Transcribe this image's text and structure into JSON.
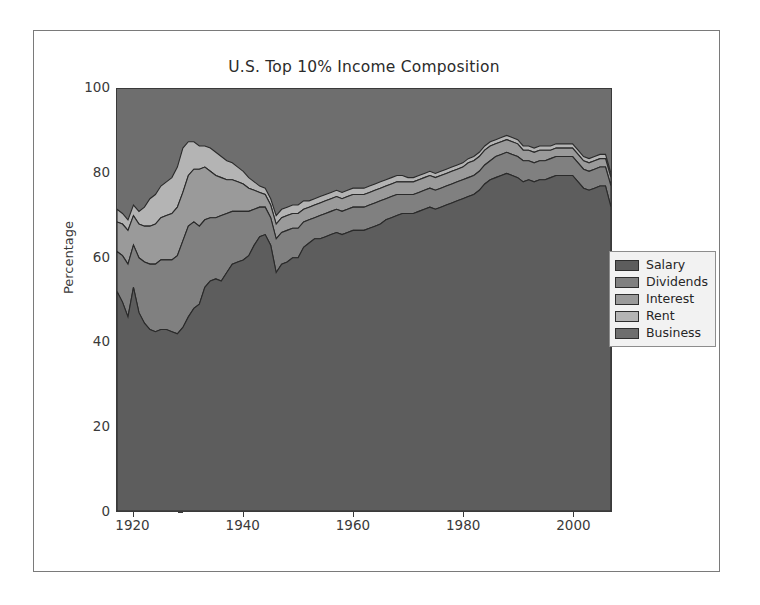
{
  "figure": {
    "title": "U.S. Top 10% Income Composition",
    "background": "#ffffff",
    "frame_color": "#7a7a7a"
  },
  "legend": {
    "position": "center-right-outside",
    "border_color": "#8d8d8d",
    "background": "#f2f2f2"
  },
  "chart_data": {
    "type": "area",
    "title": "U.S. Top 10% Income Composition",
    "xlabel": "",
    "ylabel": "Percentage",
    "xlim": [
      1917,
      2007
    ],
    "ylim": [
      0,
      100
    ],
    "xticks": [
      1920,
      1940,
      1960,
      1980,
      2000
    ],
    "yticks": [
      0,
      20,
      40,
      60,
      80,
      100
    ],
    "grid": false,
    "stacked": true,
    "legend_position": "center right",
    "x": [
      1917,
      1918,
      1919,
      1920,
      1921,
      1922,
      1923,
      1924,
      1925,
      1926,
      1927,
      1928,
      1929,
      1930,
      1931,
      1932,
      1933,
      1934,
      1935,
      1936,
      1937,
      1938,
      1939,
      1940,
      1941,
      1942,
      1943,
      1944,
      1945,
      1946,
      1947,
      1948,
      1949,
      1950,
      1951,
      1952,
      1953,
      1954,
      1955,
      1956,
      1957,
      1958,
      1959,
      1960,
      1961,
      1962,
      1963,
      1964,
      1965,
      1966,
      1967,
      1968,
      1969,
      1970,
      1971,
      1972,
      1973,
      1974,
      1975,
      1976,
      1977,
      1978,
      1979,
      1980,
      1981,
      1982,
      1983,
      1984,
      1985,
      1986,
      1987,
      1988,
      1989,
      1990,
      1991,
      1992,
      1993,
      1994,
      1995,
      1996,
      1997,
      1998,
      1999,
      2000,
      2001,
      2002,
      2003,
      2004,
      2005,
      2006,
      2007
    ],
    "series": [
      {
        "name": "Salary",
        "color": "#5d5d5d",
        "values": [
          52.0,
          49.5,
          46.0,
          53.0,
          47.0,
          44.5,
          43.0,
          42.5,
          43.0,
          43.0,
          42.5,
          42.0,
          43.5,
          46.0,
          48.0,
          49.0,
          53.0,
          54.5,
          55.0,
          54.5,
          56.5,
          58.5,
          59.0,
          59.5,
          60.5,
          63.0,
          65.0,
          65.5,
          63.0,
          56.5,
          58.5,
          59.0,
          60.0,
          60.0,
          62.5,
          63.5,
          64.5,
          64.5,
          65.0,
          65.5,
          66.0,
          65.5,
          66.0,
          66.5,
          66.5,
          66.5,
          67.0,
          67.5,
          68.0,
          69.0,
          69.5,
          70.0,
          70.5,
          70.5,
          70.5,
          71.0,
          71.5,
          72.0,
          71.5,
          72.0,
          72.5,
          73.0,
          73.5,
          74.0,
          74.5,
          75.0,
          76.0,
          77.5,
          78.5,
          79.0,
          79.5,
          80.0,
          79.5,
          79.0,
          78.0,
          78.5,
          78.0,
          78.5,
          78.5,
          79.0,
          79.5,
          79.5,
          79.5,
          79.5,
          78.0,
          76.5,
          76.0,
          76.5,
          77.0,
          77.0,
          72.0
        ]
      },
      {
        "name": "Dividends",
        "color": "#808080",
        "values": [
          9.5,
          11.0,
          12.5,
          10.0,
          13.0,
          14.5,
          15.5,
          16.0,
          16.5,
          16.5,
          17.0,
          18.5,
          20.5,
          21.5,
          20.5,
          18.5,
          16.0,
          15.0,
          14.5,
          15.5,
          14.0,
          12.5,
          12.0,
          11.5,
          10.5,
          8.5,
          7.0,
          6.5,
          6.5,
          8.0,
          7.5,
          7.5,
          7.0,
          7.0,
          6.0,
          5.5,
          5.0,
          5.5,
          5.5,
          5.5,
          5.5,
          5.5,
          5.5,
          5.5,
          5.5,
          5.5,
          5.5,
          5.5,
          5.5,
          5.0,
          5.0,
          5.0,
          4.5,
          4.5,
          4.5,
          4.5,
          4.5,
          4.5,
          4.5,
          4.5,
          4.5,
          4.5,
          4.5,
          4.5,
          4.5,
          4.5,
          4.5,
          4.5,
          4.5,
          5.0,
          5.0,
          5.0,
          5.0,
          5.0,
          5.0,
          4.5,
          4.5,
          4.5,
          4.5,
          4.5,
          4.5,
          4.5,
          4.5,
          4.5,
          4.5,
          4.5,
          4.5,
          4.5,
          4.5,
          4.5,
          5.0
        ]
      },
      {
        "name": "Interest",
        "color": "#9a9a9a",
        "values": [
          7.0,
          7.5,
          8.0,
          7.0,
          8.0,
          8.5,
          9.0,
          9.5,
          10.0,
          10.5,
          11.0,
          11.5,
          11.5,
          12.0,
          12.5,
          13.5,
          12.5,
          11.0,
          10.0,
          9.0,
          8.0,
          7.5,
          7.0,
          6.5,
          5.5,
          4.5,
          3.5,
          3.0,
          3.0,
          3.5,
          3.5,
          3.5,
          3.5,
          3.5,
          3.0,
          3.0,
          3.0,
          3.0,
          3.0,
          3.0,
          3.0,
          3.0,
          3.0,
          3.0,
          3.0,
          3.0,
          3.0,
          3.0,
          3.0,
          3.0,
          3.0,
          3.0,
          3.0,
          3.0,
          3.0,
          3.0,
          3.0,
          3.0,
          3.0,
          3.0,
          3.0,
          3.0,
          3.0,
          3.0,
          3.5,
          3.5,
          3.5,
          3.5,
          3.5,
          3.0,
          3.0,
          3.0,
          3.0,
          3.0,
          2.5,
          2.5,
          2.5,
          2.5,
          2.5,
          2.0,
          2.0,
          2.0,
          2.0,
          2.0,
          2.0,
          2.0,
          2.0,
          2.0,
          2.0,
          2.0,
          2.0
        ]
      },
      {
        "name": "Rent",
        "color": "#b4b4b4",
        "values": [
          3.0,
          2.5,
          2.5,
          2.5,
          3.0,
          4.5,
          6.5,
          7.0,
          7.5,
          8.0,
          8.5,
          9.5,
          10.5,
          8.0,
          6.5,
          5.5,
          5.0,
          5.5,
          5.5,
          5.0,
          4.5,
          4.0,
          3.5,
          3.0,
          2.5,
          2.0,
          1.5,
          1.5,
          1.5,
          2.0,
          2.0,
          2.0,
          2.0,
          2.0,
          2.0,
          1.5,
          1.5,
          1.5,
          1.5,
          1.5,
          1.5,
          1.5,
          1.5,
          1.5,
          1.5,
          1.5,
          1.5,
          1.5,
          1.5,
          1.5,
          1.5,
          1.5,
          1.5,
          1.0,
          1.0,
          1.0,
          1.0,
          1.0,
          1.0,
          1.0,
          1.0,
          1.0,
          1.0,
          1.0,
          1.0,
          1.0,
          1.0,
          1.0,
          1.0,
          1.0,
          1.0,
          1.0,
          1.0,
          1.0,
          1.0,
          1.0,
          1.0,
          1.0,
          1.0,
          1.0,
          1.0,
          1.0,
          1.0,
          1.0,
          1.0,
          1.0,
          1.0,
          1.0,
          1.0,
          1.0,
          1.0
        ]
      },
      {
        "name": "Business",
        "color": "#6e6e6e",
        "values": [
          0.5,
          0.5,
          0.5,
          0.5,
          0.5,
          0.5,
          0.5,
          0.5,
          0.5,
          0.5,
          0.5,
          0.5,
          0.5,
          0.5,
          0.5,
          0.5,
          0.5,
          0.5,
          0.5,
          0.5,
          0.5,
          0.5,
          0.5,
          0.5,
          0.5,
          0.5,
          0.5,
          0.5,
          0.5,
          0.5,
          0.5,
          0.5,
          0.5,
          0.5,
          0.5,
          0.5,
          0.5,
          0.5,
          0.5,
          0.5,
          0.5,
          0.5,
          0.5,
          0.5,
          0.5,
          0.5,
          0.5,
          0.5,
          0.5,
          0.5,
          0.5,
          0.5,
          0.5,
          0.5,
          0.5,
          0.5,
          0.5,
          0.5,
          0.5,
          0.5,
          0.5,
          0.5,
          0.5,
          0.5,
          0.5,
          0.5,
          0.5,
          0.5,
          0.5,
          0.5,
          0.5,
          0.5,
          0.5,
          0.5,
          0.5,
          0.5,
          0.5,
          0.5,
          0.5,
          0.5,
          0.5,
          0.5,
          0.5,
          0.5,
          0.5,
          0.5,
          0.5,
          0.5,
          0.5,
          0.5,
          0.5
        ]
      }
    ]
  }
}
